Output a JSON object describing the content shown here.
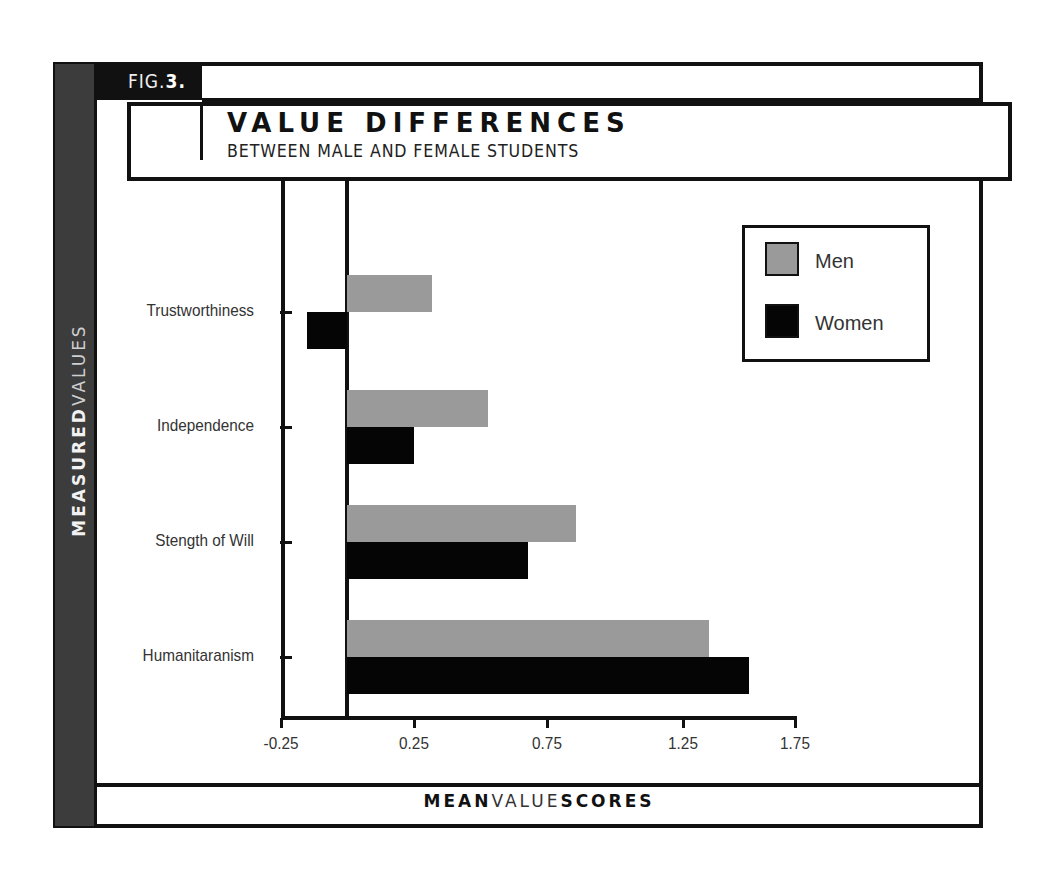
{
  "figure": {
    "fig_prefix": "FIG.",
    "fig_number": "3.",
    "title": "VALUE DIFFERENCES",
    "subtitle": "BETWEEN MALE AND FEMALE STUDENTS",
    "y_axis_title_bold": "MEASURED",
    "y_axis_title_light": "VALUES",
    "x_axis_title_bold_1": "MEAN",
    "x_axis_title_light": "VALUE",
    "x_axis_title_bold_2": "SCORES"
  },
  "colors": {
    "men": "#9a9a9a",
    "women": "#050505",
    "side_bar": "#3c3c3c",
    "frame": "#111111"
  },
  "chart_data": {
    "type": "bar",
    "orientation": "horizontal",
    "title": "VALUE DIFFERENCES",
    "subtitle": "BETWEEN MALE AND FEMALE STUDENTS",
    "xlabel": "MEAN VALUE SCORES",
    "ylabel": "MEASURED VALUES",
    "categories": [
      "Trustworthiness",
      "Independence",
      "Stength of Will",
      "Humanitaranism"
    ],
    "series": [
      {
        "name": "Men",
        "color": "#9a9a9a",
        "values": [
          0.32,
          0.53,
          0.86,
          1.36
        ]
      },
      {
        "name": "Women",
        "color": "#050505",
        "values": [
          -0.15,
          0.25,
          0.68,
          1.51
        ]
      }
    ],
    "x_ticks": [
      "-0.25",
      "0.25",
      "0.75",
      "1.25",
      "1.75"
    ],
    "xlim": [
      -0.25,
      1.75
    ],
    "grid": false,
    "legend_position": "upper right"
  },
  "legend": {
    "items": [
      {
        "label": "Men"
      },
      {
        "label": "Women"
      }
    ]
  }
}
